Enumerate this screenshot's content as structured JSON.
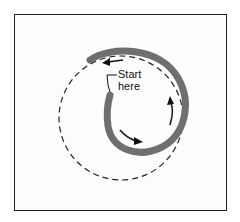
{
  "diagram": {
    "label": {
      "line1": "Start",
      "line2": "here"
    },
    "colors": {
      "spiral": "#6f6f6f",
      "dashed": "#222222",
      "arrow": "#111111",
      "frame": "#222222"
    },
    "elements": [
      "frame",
      "dashed-circle-path",
      "spiral-path",
      "direction-arrows",
      "start-label"
    ]
  }
}
